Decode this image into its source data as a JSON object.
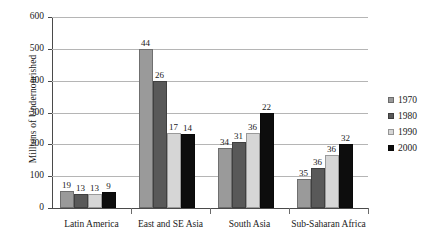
{
  "chart_data": {
    "type": "bar",
    "title": "",
    "subtitle": "",
    "xlabel": "",
    "ylabel": "Millions of Undernourished",
    "ylim": [
      0,
      600
    ],
    "yticks": [
      0,
      100,
      200,
      300,
      400,
      500,
      600
    ],
    "ytick_labels": [
      "0",
      "100",
      "200",
      "300",
      "400",
      "500",
      "600"
    ],
    "grid": true,
    "legend_position": "right",
    "categories": [
      "Latin America",
      "East and SE Asia",
      "South Asia",
      "Sub-Saharan Africa"
    ],
    "series": [
      {
        "name": "1970",
        "color": "#9a9a9a",
        "values": [
          52,
          500,
          190,
          90
        ],
        "data_labels": [
          "19",
          "44",
          "34",
          "35"
        ]
      },
      {
        "name": "1980",
        "color": "#595959",
        "values": [
          45,
          398,
          206,
          126
        ],
        "data_labels": [
          "13",
          "26",
          "31",
          "36"
        ]
      },
      {
        "name": "1990",
        "color": "#d6d6d6",
        "values": [
          45,
          236,
          236,
          165
        ],
        "data_labels": [
          "13",
          "17",
          "36",
          "36"
        ]
      },
      {
        "name": "2000",
        "color": "#0d0d0d",
        "values": [
          49,
          234,
          300,
          200
        ],
        "data_labels": [
          "9",
          "14",
          "22",
          "32"
        ]
      }
    ],
    "annotations": "Bar data labels show percentage of population undernourished; bar heights show millions of undernourished."
  },
  "legend": {
    "entries": [
      {
        "label": "1970",
        "color": "#9a9a9a"
      },
      {
        "label": "1980",
        "color": "#595959"
      },
      {
        "label": "1990",
        "color": "#d6d6d6"
      },
      {
        "label": "2000",
        "color": "#0d0d0d"
      }
    ]
  },
  "colors": {
    "background": "#ffffff",
    "axis": "#4a4a4a",
    "gridline": "#b5b5b5",
    "text": "#1a1a1a"
  }
}
